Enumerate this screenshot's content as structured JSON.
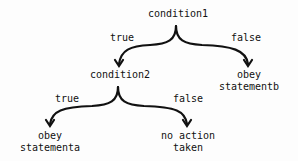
{
  "diagram": {
    "type": "decision-tree",
    "stroke_color": "#111111",
    "background": "#fdfdfd",
    "nodes": {
      "condition1": "condition1",
      "condition2": "condition2",
      "obey_b_line1": "obey",
      "obey_b_line2": "statementb",
      "obey_a_line1": "obey",
      "obey_a_line2": "statementa",
      "no_action_line1": "no action",
      "no_action_line2": "taken"
    },
    "edges": {
      "c1_true": "true",
      "c1_false": "false",
      "c2_true": "true",
      "c2_false": "false"
    }
  }
}
